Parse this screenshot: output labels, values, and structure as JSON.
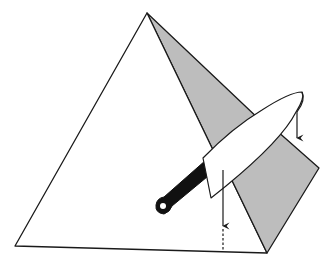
{
  "diagram": {
    "title": "Cutting a pyramid-shaped cake with a knife",
    "colors": {
      "background": "#ffffff",
      "outline": "#1a1a1a",
      "shaded_face": "#bdbdbd",
      "knife_blade": "#ffffff",
      "knife_handle": "#111111"
    },
    "elements": [
      {
        "name": "pyramid-front-face",
        "fill": "white"
      },
      {
        "name": "pyramid-shaded-face",
        "fill": "gray"
      },
      {
        "name": "cut-flap",
        "fill": "gray"
      },
      {
        "name": "knife",
        "parts": [
          "blade",
          "handle"
        ]
      },
      {
        "name": "arrow-blade-tip",
        "direction": "down"
      },
      {
        "name": "arrow-cut-line",
        "direction": "down"
      },
      {
        "name": "dashed-cut-line"
      }
    ]
  }
}
